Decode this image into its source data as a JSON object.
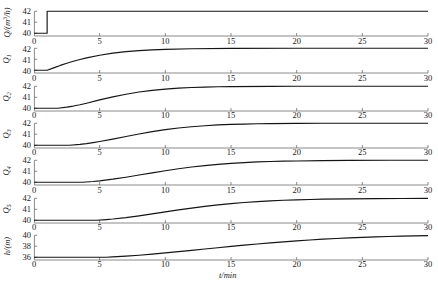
{
  "figure": {
    "xlabel": "t/min",
    "x_ticks": [
      0,
      5,
      10,
      15,
      20,
      25,
      30
    ]
  },
  "chart_data": {
    "type": "line",
    "title": "",
    "xlabel": "t/min",
    "ylabel": "",
    "xlim": [
      0,
      30
    ],
    "grid": false,
    "legend": "none",
    "panels": [
      {
        "ylabel_html": "Q/(m<sup>3</sup>/h)",
        "ylabel_text": "Q/(m3/h)",
        "y_ticks": [
          40,
          41,
          42
        ],
        "ylim": [
          39.75,
          42.3
        ],
        "shape": "step",
        "step_time": 1.0,
        "x": [
          0,
          1,
          1,
          30
        ],
        "y": [
          40,
          40,
          42,
          42
        ]
      },
      {
        "ylabel_html": "Q<sub>1</sub>",
        "ylabel_text": "Q1",
        "y_ticks": [
          40,
          41,
          42
        ],
        "ylim": [
          39.75,
          42.3
        ],
        "shape": "first-order",
        "delay": 1.0,
        "tau": 2.0,
        "x": [
          0,
          1,
          1.5,
          2,
          2.5,
          3,
          3.5,
          4,
          5,
          6,
          7,
          8,
          9,
          10,
          12,
          15,
          20,
          25,
          30
        ],
        "y": [
          40,
          40,
          40.22,
          40.44,
          40.64,
          40.82,
          40.98,
          41.13,
          41.37,
          41.56,
          41.7,
          41.79,
          41.86,
          41.9,
          41.96,
          41.99,
          42,
          42,
          42
        ]
      },
      {
        "ylabel_html": "Q<sub>2</sub>",
        "ylabel_text": "Q2",
        "y_ticks": [
          40,
          41,
          42
        ],
        "ylim": [
          39.75,
          42.3
        ],
        "shape": "second-order",
        "delay": 1.8,
        "tau": 3.0,
        "x": [
          0,
          1.8,
          2.5,
          3,
          3.5,
          4,
          5,
          6,
          7,
          8,
          9,
          10,
          11,
          12,
          13,
          14,
          15,
          18,
          20,
          25,
          30
        ],
        "y": [
          40,
          40,
          40.1,
          40.2,
          40.32,
          40.46,
          40.76,
          41.04,
          41.28,
          41.48,
          41.63,
          41.74,
          41.83,
          41.89,
          41.93,
          41.96,
          41.97,
          41.99,
          42,
          42,
          42
        ]
      },
      {
        "ylabel_html": "Q<sub>3</sub>",
        "ylabel_text": "Q3",
        "y_ticks": [
          40,
          41,
          42
        ],
        "ylim": [
          39.75,
          42.3
        ],
        "shape": "third-order",
        "delay": 2.7,
        "tau": 4.0,
        "x": [
          0,
          2.7,
          3.5,
          4,
          4.5,
          5,
          6,
          7,
          8,
          9,
          10,
          11,
          12,
          13,
          14,
          15,
          16,
          17,
          18,
          20,
          22,
          25,
          30
        ],
        "y": [
          40,
          40,
          40.08,
          40.15,
          40.24,
          40.34,
          40.56,
          40.8,
          41.03,
          41.24,
          41.42,
          41.57,
          41.69,
          41.78,
          41.85,
          41.9,
          41.93,
          41.96,
          41.97,
          41.99,
          42,
          42,
          42
        ]
      },
      {
        "ylabel_html": "Q<sub>4</sub>",
        "ylabel_text": "Q4",
        "y_ticks": [
          40,
          41,
          42
        ],
        "ylim": [
          39.75,
          42.3
        ],
        "shape": "fourth-order",
        "delay": 3.7,
        "tau": 5.0,
        "x": [
          0,
          3.7,
          4.5,
          5,
          6,
          7,
          8,
          9,
          10,
          11,
          12,
          13,
          14,
          15,
          16,
          17,
          18,
          19,
          20,
          22,
          24,
          27,
          30
        ],
        "y": [
          40,
          40,
          40.07,
          40.13,
          40.28,
          40.46,
          40.66,
          40.86,
          41.05,
          41.23,
          41.39,
          41.52,
          41.63,
          41.72,
          41.79,
          41.85,
          41.89,
          41.92,
          41.94,
          41.97,
          41.99,
          42,
          42
        ]
      },
      {
        "ylabel_html": "Q<sub>5</sub>",
        "ylabel_text": "Q5",
        "y_ticks": [
          40,
          41,
          42
        ],
        "ylim": [
          39.75,
          42.3
        ],
        "shape": "fifth-order",
        "delay": 4.8,
        "tau": 6.0,
        "x": [
          0,
          4.8,
          5.5,
          6,
          7,
          8,
          9,
          10,
          11,
          12,
          13,
          14,
          15,
          16,
          17,
          18,
          19,
          20,
          21,
          22,
          24,
          26,
          28,
          30
        ],
        "y": [
          40,
          40,
          40.06,
          40.11,
          40.24,
          40.4,
          40.58,
          40.76,
          40.94,
          41.11,
          41.26,
          41.4,
          41.52,
          41.62,
          41.7,
          41.77,
          41.82,
          41.86,
          41.89,
          41.92,
          41.95,
          41.97,
          41.98,
          41.99
        ]
      },
      {
        "ylabel_html": "h/(m)",
        "ylabel_text": "h/(m)",
        "y_ticks": [
          36,
          38,
          40
        ],
        "ylim": [
          35.5,
          40.6
        ],
        "shape": "ramp-saturating",
        "delay": 5.5,
        "tau": 7.0,
        "x": [
          0,
          5.5,
          6,
          7,
          8,
          9,
          10,
          11,
          12,
          13,
          14,
          15,
          16,
          17,
          18,
          19,
          20,
          21,
          22,
          23,
          24,
          25,
          26,
          27,
          28,
          29,
          30
        ],
        "y": [
          36,
          36,
          36.06,
          36.2,
          36.37,
          36.57,
          36.79,
          37.02,
          37.26,
          37.5,
          37.74,
          37.97,
          38.2,
          38.42,
          38.62,
          38.81,
          38.99,
          39.15,
          39.29,
          39.42,
          39.53,
          39.63,
          39.71,
          39.78,
          39.84,
          39.89,
          39.93
        ]
      }
    ]
  }
}
